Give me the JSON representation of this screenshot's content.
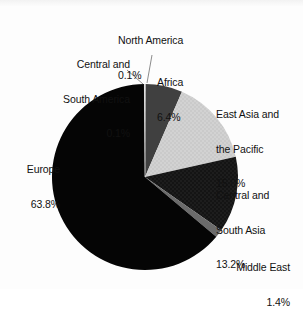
{
  "chart_data": {
    "type": "pie",
    "title": "",
    "subtitle": "",
    "xlabel": "",
    "ylabel": "",
    "legend_position": "none",
    "grid": false,
    "start_angle_deg": 0,
    "direction": "clockwise",
    "units": "percent",
    "categories": [
      "North America",
      "Africa",
      "East Asia and the Pacific",
      "Central and South Asia",
      "Middle East",
      "Europe",
      "Central and South America"
    ],
    "values": [
      0.1,
      6.4,
      15.0,
      13.2,
      1.4,
      63.8,
      0.1
    ],
    "value_labels": [
      "0.1%",
      "6.4%",
      "15.0%",
      "13.2%",
      "1.4%",
      "63.8%",
      "0.1%"
    ],
    "colors": [
      "#f4f4f4",
      "#404040",
      "#d2d2d2",
      "#141414",
      "#6b6b6b",
      "#050505",
      "#fafafa"
    ],
    "slices": [
      {
        "name": "North America",
        "value": 0.1,
        "label_line1": "North America",
        "label_pct": "0.1%",
        "color": "#f4f4f4",
        "leader_line": true
      },
      {
        "name": "Africa",
        "value": 6.4,
        "label_line1": "Africa",
        "label_pct": "6.4%",
        "color": "#404040",
        "leader_line": false
      },
      {
        "name": "East Asia and the Pacific",
        "value": 15.0,
        "label_line1": "East Asia and",
        "label_line2": "the Pacific",
        "label_pct": "15.0%",
        "color": "#d2d2d2",
        "leader_line": false
      },
      {
        "name": "Central and South Asia",
        "value": 13.2,
        "label_line1": "Central and",
        "label_line2": "South Asia",
        "label_pct": "13.2%",
        "color": "#141414",
        "leader_line": false
      },
      {
        "name": "Middle East",
        "value": 1.4,
        "label_line1": "Middle East",
        "label_pct": "1.4%",
        "color": "#6b6b6b",
        "leader_line": false
      },
      {
        "name": "Europe",
        "value": 63.8,
        "label_line1": "Europe",
        "label_pct": "63.8%",
        "color": "#050505",
        "leader_line": false
      },
      {
        "name": "Central and South America",
        "value": 0.1,
        "label_line1": "Central and",
        "label_line2": "South America",
        "label_pct": "0.1%",
        "color": "#fafafa",
        "leader_line": true
      }
    ]
  },
  "labels": {
    "north_america": {
      "l1": "North America",
      "pct": "0.1%"
    },
    "central_south_america": {
      "l1": "Central and",
      "l2": "South America",
      "pct": "0.1%"
    },
    "africa": {
      "l1": "Africa",
      "pct": "6.4%"
    },
    "east_asia_pacific": {
      "l1": "East Asia and",
      "l2": "the Pacific",
      "pct": "15.0%"
    },
    "central_south_asia": {
      "l1": "Central and",
      "l2": "South Asia",
      "pct": "13.2%"
    },
    "middle_east": {
      "l1": "Middle East",
      "pct": "1.4%"
    },
    "europe": {
      "l1": "Europe",
      "pct": "63.8%"
    }
  }
}
